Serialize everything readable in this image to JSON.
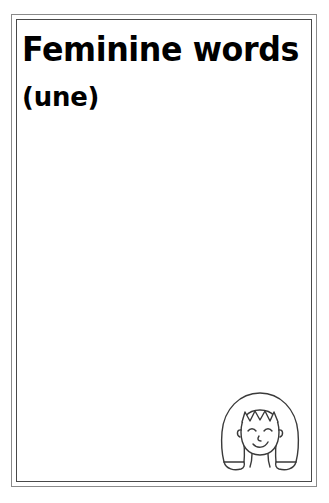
{
  "page": {
    "background_color": "#ffffff",
    "border_outer_color": "#8a8a8a",
    "border_inner_color": "#4a4a4a",
    "text_color": "#000000"
  },
  "heading": {
    "title": "Feminine words",
    "subtitle": "(une)"
  },
  "answer_area": {
    "content": "",
    "placeholder": ""
  },
  "illustration": {
    "name": "girl-face-illustration",
    "description": "Line drawing of a smiling girl with a bob haircut and zigzag bangs",
    "stroke_color": "#3a3a3a",
    "fill_color": "#ffffff",
    "parts": [
      "hair-outline",
      "left-hair-lobe",
      "right-hair-lobe",
      "face-outline",
      "bangs-zigzag",
      "left-ear",
      "right-ear",
      "left-eye",
      "right-eye",
      "nose",
      "smile",
      "neck"
    ]
  }
}
